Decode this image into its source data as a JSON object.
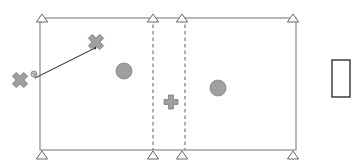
{
  "canvas": {
    "width": 359,
    "height": 168,
    "background": "#ffffff"
  },
  "palette": {
    "outline_stroke": "#8a8a8a",
    "marker_stroke": "#555555",
    "dashed_stroke": "#6e6e6e",
    "shape_fill": "#a0a0a0",
    "shape_stroke": "#777777",
    "connector_stroke": "#4a4a4a",
    "box_stroke": "#333333",
    "box_fill": "#ffffff",
    "triangle_fill": "#ffffff"
  },
  "floorplan": {
    "name": "room-outline",
    "label": "Room boundary rectangle",
    "x": 40,
    "y": 18,
    "width": 256,
    "height": 132
  },
  "dashed_dividers": [
    {
      "name": "dashed-divider-left",
      "x": 153,
      "y1": 18,
      "y2": 150
    },
    {
      "name": "dashed-divider-right",
      "x": 185,
      "y1": 18,
      "y2": 150
    }
  ],
  "triangle_markers": [
    {
      "name": "triangle-marker-top-left",
      "cx": 42,
      "cy": 18
    },
    {
      "name": "triangle-marker-top-mid-left",
      "cx": 153,
      "cy": 18
    },
    {
      "name": "triangle-marker-top-mid-right",
      "cx": 182,
      "cy": 18
    },
    {
      "name": "triangle-marker-top-right",
      "cx": 293,
      "cy": 18
    },
    {
      "name": "triangle-marker-bottom-left",
      "cx": 42,
      "cy": 155
    },
    {
      "name": "triangle-marker-bottom-mid-left",
      "cx": 153,
      "cy": 155
    },
    {
      "name": "triangle-marker-bottom-mid-right",
      "cx": 182,
      "cy": 155
    },
    {
      "name": "triangle-marker-bottom-right",
      "cx": 293,
      "cy": 155
    }
  ],
  "cross_markers": [
    {
      "name": "cross-marker-outer-left",
      "cx": 20,
      "cy": 80,
      "size": 8,
      "rotation": 45
    },
    {
      "name": "cross-marker-upper",
      "cx": 96,
      "cy": 42,
      "size": 8,
      "rotation": 45
    },
    {
      "name": "cross-marker-center",
      "cx": 171,
      "cy": 102,
      "size": 7,
      "rotation": 0
    }
  ],
  "dot_markers": [
    {
      "name": "speckled-dot-marker",
      "cx": 34,
      "cy": 74,
      "r": 3
    }
  ],
  "circle_markers": [
    {
      "name": "circle-marker-left",
      "cx": 124,
      "cy": 71,
      "r": 8
    },
    {
      "name": "circle-marker-right",
      "cx": 218,
      "cy": 88,
      "r": 8
    }
  ],
  "connector": {
    "name": "connector-line",
    "x1": 35,
    "y1": 78,
    "x2": 95,
    "y2": 48
  },
  "side_box": {
    "name": "side-rectangle",
    "x": 332,
    "y": 60,
    "width": 18,
    "height": 37
  }
}
